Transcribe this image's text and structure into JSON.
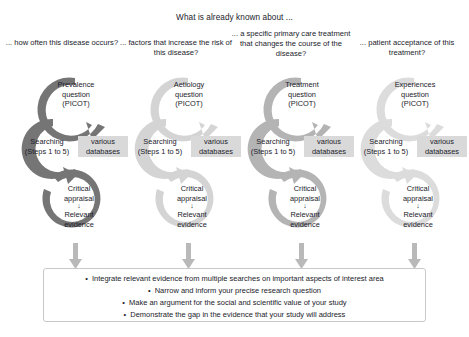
{
  "heading": "What is already known about ...",
  "colors": {
    "ring_dark": "#757575",
    "ring_light": "#d4d4d4",
    "ring_mid": "#b4b4b4",
    "ring_pale": "#dcdcdc",
    "chip_bg": "#d9d9d9",
    "box_border": "#c9c9c9",
    "text": "#1b1b2b",
    "connector": "#b9b9b9"
  },
  "columns": [
    {
      "id": "prevalence",
      "heading": "... how often this disease occurs?",
      "question": "Prevalence question (PICOT)",
      "question_lines": [
        "Prevalence",
        "question",
        "(PICOT)"
      ],
      "searching_lines": [
        "Searching",
        "(Steps 1 to 5)"
      ],
      "databases_lines": [
        "various",
        "databases"
      ],
      "appraisal_lines": [
        "Critical",
        "appraisal"
      ],
      "evidence_lines": [
        "Relevant",
        "evidence"
      ],
      "ring_color": "#757575"
    },
    {
      "id": "aetiology",
      "heading": "... factors that increase the risk of this disease?",
      "question": "Aetiology question (PICOT)",
      "question_lines": [
        "Aetiology",
        "question",
        "(PICOT)"
      ],
      "searching_lines": [
        "Searching",
        "(Steps 1 to 5)"
      ],
      "databases_lines": [
        "various",
        "databases"
      ],
      "appraisal_lines": [
        "Critical",
        "appraisal"
      ],
      "evidence_lines": [
        "Relevant",
        "evidence"
      ],
      "ring_color": "#d4d4d4"
    },
    {
      "id": "treatment",
      "heading": "... a specific primary care treatment that changes the course of the disease?",
      "question": "Treatment question (PICOT)",
      "question_lines": [
        "Treatment",
        "question",
        "(PICOT)"
      ],
      "searching_lines": [
        "Searching",
        "(Steps 1 to 5)"
      ],
      "databases_lines": [
        "various",
        "databases"
      ],
      "appraisal_lines": [
        "Critical",
        "appraisal"
      ],
      "evidence_lines": [
        "Relevant",
        "evidence"
      ],
      "ring_color": "#b4b4b4"
    },
    {
      "id": "experiences",
      "heading": "... patient acceptance of this treatment?",
      "question": "Experiences question (PICOT)",
      "question_lines": [
        "Experiences",
        "question",
        "(PICOT)"
      ],
      "searching_lines": [
        "Searching",
        "(Steps 1 to 5)"
      ],
      "databases_lines": [
        "various",
        "databases"
      ],
      "appraisal_lines": [
        "Critical",
        "appraisal"
      ],
      "evidence_lines": [
        "Relevant",
        "evidence"
      ],
      "ring_color": "#dcdcdc"
    }
  ],
  "summary": {
    "bullets": [
      "Integrate relevant evidence from multiple searches on important aspects of interest area",
      "Narrow and inform your precise research question",
      "Make an argument for the social and scientific value of your study",
      "Demonstrate the gap in the evidence that your study will address"
    ]
  }
}
